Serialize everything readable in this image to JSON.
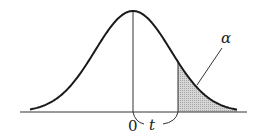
{
  "chart_data": {
    "type": "area",
    "title": "",
    "xlabel": "",
    "ylabel": "",
    "grid": false,
    "legend": null,
    "curve": "normal density",
    "tick_labels": [
      "0"
    ],
    "markers": [
      {
        "name": "center",
        "label": "0"
      },
      {
        "name": "critical_value",
        "label": "t"
      }
    ],
    "shaded_region": {
      "from": "t",
      "to": "+inf",
      "label": "α",
      "meaning": "upper tail area"
    },
    "annotations": [
      "α",
      "0",
      "t"
    ]
  },
  "labels": {
    "zero": "0",
    "t": "t",
    "alpha": "α"
  },
  "colors": {
    "curve": "#1a1a1a",
    "axis": "#333333",
    "shade": "#c8c8c8"
  }
}
